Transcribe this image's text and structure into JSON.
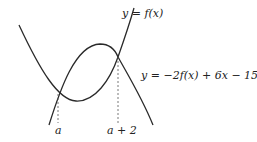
{
  "labels": {
    "f_curve": "y = f(x)",
    "g_curve": "y = −2f(x) + 6x − 15",
    "x_a": "a",
    "x_a2": "a + 2"
  },
  "colors": {
    "curve": "#2a2a2a",
    "dashed": "#555555"
  }
}
